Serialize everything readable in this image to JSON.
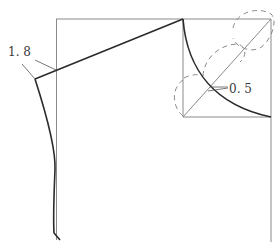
{
  "diagram": {
    "type": "garment-pattern-draft",
    "labels": {
      "shoulder_offset": "1. 8",
      "curve_offset": "0. 5"
    },
    "colors": {
      "guide_line": "#8a8a8a",
      "pattern_line": "#2a2a2a",
      "dashed_line": "#8a8a8a"
    },
    "measurements": [
      {
        "name": "shoulder-drop",
        "value": 1.8
      },
      {
        "name": "neck-curve-offset",
        "value": 0.5
      }
    ]
  }
}
